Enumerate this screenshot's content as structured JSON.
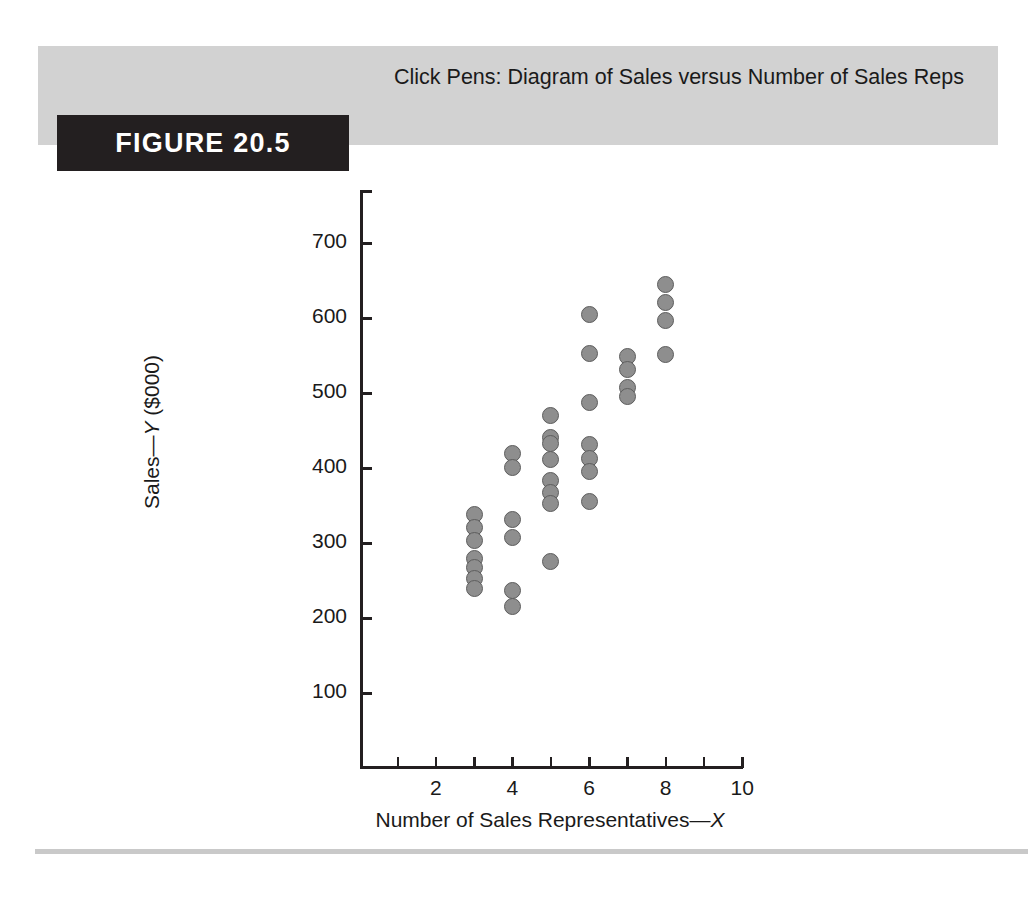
{
  "figure": {
    "tag_label": "FIGURE 20.5",
    "title": "Click Pens: Diagram of Sales versus Number of Sales Reps"
  },
  "colors": {
    "header_band": "#d2d2d2",
    "tag_background": "#231f20",
    "tag_text": "#ffffff",
    "marker_fill": "#8e8e8e",
    "marker_stroke": "#5d5d5d",
    "axis": "#231f20",
    "footer_rule": "#c9c9c9",
    "page_background": "#ffffff"
  },
  "chart_data": {
    "type": "scatter",
    "title": "Click Pens: Diagram of Sales versus Number of Sales Reps",
    "xlabel": "Number of Sales Representatives—X",
    "ylabel": "Sales—Y ($000)",
    "xlim": [
      0,
      10.5
    ],
    "ylim": [
      0,
      760
    ],
    "grid": false,
    "legend": null,
    "x_ticks": [
      1,
      2,
      3,
      4,
      5,
      6,
      7,
      8,
      9,
      10
    ],
    "x_tick_labels": [
      "",
      "2",
      "",
      "4",
      "",
      "6",
      "",
      "8",
      "",
      "10"
    ],
    "y_ticks": [
      100,
      200,
      300,
      400,
      500,
      600,
      700
    ],
    "y_tick_labels": [
      "100",
      "200",
      "300",
      "400",
      "500",
      "600",
      "700"
    ],
    "points": [
      {
        "x": 3,
        "y": 338
      },
      {
        "x": 3,
        "y": 321
      },
      {
        "x": 3,
        "y": 304
      },
      {
        "x": 3,
        "y": 280
      },
      {
        "x": 3,
        "y": 267
      },
      {
        "x": 3,
        "y": 253
      },
      {
        "x": 3,
        "y": 240
      },
      {
        "x": 4,
        "y": 420
      },
      {
        "x": 4,
        "y": 401
      },
      {
        "x": 4,
        "y": 331
      },
      {
        "x": 4,
        "y": 308
      },
      {
        "x": 4,
        "y": 237
      },
      {
        "x": 4,
        "y": 215
      },
      {
        "x": 5,
        "y": 470
      },
      {
        "x": 5,
        "y": 441
      },
      {
        "x": 5,
        "y": 433
      },
      {
        "x": 5,
        "y": 411
      },
      {
        "x": 5,
        "y": 383
      },
      {
        "x": 5,
        "y": 368
      },
      {
        "x": 5,
        "y": 353
      },
      {
        "x": 5,
        "y": 275
      },
      {
        "x": 6,
        "y": 605
      },
      {
        "x": 6,
        "y": 553
      },
      {
        "x": 6,
        "y": 488
      },
      {
        "x": 6,
        "y": 431
      },
      {
        "x": 6,
        "y": 413
      },
      {
        "x": 6,
        "y": 395
      },
      {
        "x": 6,
        "y": 355
      },
      {
        "x": 7,
        "y": 549
      },
      {
        "x": 7,
        "y": 531
      },
      {
        "x": 7,
        "y": 507
      },
      {
        "x": 7,
        "y": 495
      },
      {
        "x": 8,
        "y": 645
      },
      {
        "x": 8,
        "y": 621
      },
      {
        "x": 8,
        "y": 597
      },
      {
        "x": 8,
        "y": 551
      }
    ]
  }
}
